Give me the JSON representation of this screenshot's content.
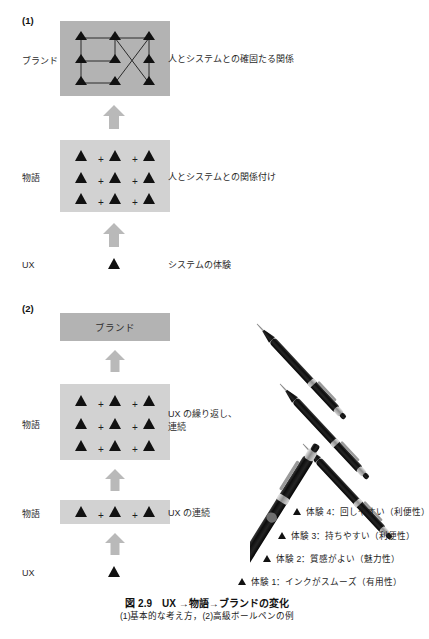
{
  "figure": {
    "caption_main": "図 2.9　UX →物語→ブランドの変化",
    "caption_sub": "(1)基本的な考え方，(2)高級ボールペンの例"
  },
  "section1": {
    "marker": "(1)",
    "tiers": [
      {
        "label": "ブランド",
        "description": "人とシステムとの確固たる関係"
      },
      {
        "label": "物語",
        "description": "人とシステムとの関係付け"
      },
      {
        "label": "UX",
        "description": "システムの体験"
      }
    ],
    "story_plus": "+"
  },
  "section2": {
    "marker": "(2)",
    "brand_box_label": "ブランド",
    "tiers": [
      {
        "label": "物語",
        "description": "UX の繰り返し、\n連続"
      },
      {
        "label": "物語",
        "description": "UX の連続"
      },
      {
        "label": "UX",
        "description": ""
      }
    ],
    "story_plus": "+",
    "experiences": [
      {
        "text": "体験 4：回しやすい（利便性）"
      },
      {
        "text": "体験 3：持ちやすい（利便性）"
      },
      {
        "text": "体験 2：質感がよい（魅力性）"
      },
      {
        "text": "体験 1：インクがスムーズ（有用性）"
      }
    ]
  },
  "colors": {
    "panel_dark": "#b3b3b3",
    "panel_light": "#d2d2d2",
    "arrow": "#b9b9b9",
    "triangle": "#111111",
    "pen_body": "#141414"
  }
}
